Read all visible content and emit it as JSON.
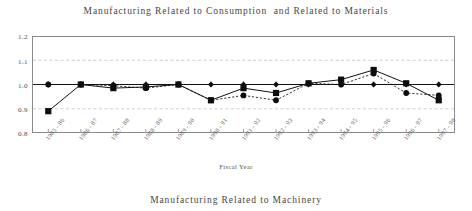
{
  "figure": {
    "title": "Manufacturing Related to Consumption  and Related to Materials",
    "bottom_caption": "Manufacturing Related to Machinery"
  },
  "chart_data": {
    "type": "line",
    "title": "Manufacturing Related to Consumption  and Related to Materials",
    "xlabel": "Fiscal Year",
    "ylabel": "",
    "ylim": [
      0.8,
      1.2
    ],
    "yticks": [
      0.8,
      0.9,
      1.0,
      1.1,
      1.2
    ],
    "ytick_labels": [
      "0.8",
      "0.9",
      "1.0",
      "1.1",
      "1.2"
    ],
    "grid": true,
    "legend_position": "none",
    "categories": [
      "1985 - 86",
      "1986 - 87",
      "1987 - 88",
      "1988 - 89",
      "1989 - 90",
      "1990 - 91",
      "1991 - 92",
      "1992 - 93",
      "1993 - 94",
      "1994 - 95",
      "1995 - 96",
      "1996 - 97",
      "1997 - 98"
    ],
    "series": [
      {
        "name": "Manufacturing Related to Consumption",
        "marker": "diamond",
        "line_style": "solid",
        "values": [
          1.0,
          1.0,
          1.0,
          1.0,
          1.0,
          1.0,
          1.0,
          1.0,
          1.0,
          1.0,
          1.0,
          1.0,
          1.0
        ]
      },
      {
        "name": "Manufacturing Related to Materials",
        "marker": "square",
        "line_style": "solid",
        "values": [
          0.89,
          1.0,
          0.985,
          0.99,
          1.0,
          0.935,
          0.985,
          0.965,
          1.005,
          1.02,
          1.06,
          1.005,
          0.935
        ]
      },
      {
        "name": "Manufacturing Related to Machinery",
        "marker": "dot",
        "line_style": "dotted",
        "values": [
          1.0,
          1.0,
          0.995,
          0.985,
          1.0,
          0.935,
          0.955,
          0.935,
          1.005,
          1.0,
          1.045,
          0.965,
          0.955
        ]
      }
    ]
  }
}
